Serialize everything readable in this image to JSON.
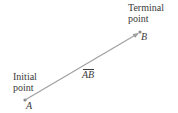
{
  "diagram": {
    "type": "vector",
    "initial_point": {
      "caption_line1": "Initial",
      "caption_line2": "point",
      "label": "A",
      "x": 25,
      "y": 100
    },
    "terminal_point": {
      "caption_line1": "Terminal",
      "caption_line2": "point",
      "label": "B",
      "x": 140,
      "y": 32
    },
    "vector_label": "AB",
    "colors": {
      "arrow": "#a0a0a0",
      "point": "#8c8c8c",
      "text": "#3a3a3a"
    }
  }
}
